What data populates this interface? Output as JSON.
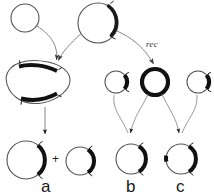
{
  "figure": {
    "background_color": "#ffffff",
    "line_color": "#4d4d4d",
    "bold_color": "#111111",
    "width": 214,
    "height": 196
  },
  "labels": {
    "rec": "rec",
    "plus": "+",
    "panel_a": "a",
    "panel_b": "b",
    "panel_c": "c"
  },
  "diagram_data": {
    "type": "diagram",
    "nodes": [
      {
        "id": "top-left-circle",
        "name": "small-thin-circle-top-left",
        "shape": "circle",
        "cx": 25,
        "cy": 18,
        "r": 14,
        "stroke": "thin",
        "segments": []
      },
      {
        "id": "top-center-circle",
        "name": "circle-top-center-with-thick-arc",
        "shape": "circle",
        "cx": 98,
        "cy": 23,
        "r": 20,
        "stroke": "thin",
        "segments": [
          {
            "type": "thick-arc",
            "start_deg": -58,
            "end_deg": 48,
            "ticks": 2
          }
        ]
      },
      {
        "id": "left-lens",
        "name": "heteroduplex-lens-shape",
        "shape": "lens",
        "cx": 38,
        "cy": 83,
        "rx": 33,
        "ry": 22,
        "stroke": "thin",
        "segments": [
          {
            "type": "thick-arc",
            "position": "upper",
            "ticks": 2
          },
          {
            "type": "thick-arc",
            "position": "lower",
            "ticks": 2
          }
        ]
      },
      {
        "id": "mid-small-circle",
        "name": "small-circle-mid-left-with-arc",
        "shape": "circle",
        "cx": 116,
        "cy": 82,
        "r": 11,
        "stroke": "thin",
        "segments": [
          {
            "type": "thick-arc",
            "start_deg": -25,
            "end_deg": 25,
            "ticks": 2
          }
        ]
      },
      {
        "id": "mid-bold-circle",
        "name": "bold-circle-recombinant",
        "shape": "circle",
        "cx": 155,
        "cy": 82,
        "r": 13,
        "stroke": "bold",
        "segments": []
      },
      {
        "id": "mid-right-circle",
        "name": "small-circle-mid-right-with-arc",
        "shape": "circle",
        "cx": 198,
        "cy": 82,
        "r": 11,
        "stroke": "thin",
        "segments": [
          {
            "type": "thick-arc",
            "start_deg": -25,
            "end_deg": 25,
            "ticks": 2
          }
        ]
      },
      {
        "id": "a-large-circle",
        "name": "panel-a-large-product-circle",
        "shape": "circle",
        "cx": 26,
        "cy": 160,
        "r": 19,
        "stroke": "thin",
        "segments": [
          {
            "type": "thick-arc",
            "start_deg": -52,
            "end_deg": 52,
            "ticks": 2
          }
        ]
      },
      {
        "id": "a-small-circle",
        "name": "panel-a-small-product-circle",
        "shape": "circle",
        "cx": 80,
        "cy": 161,
        "r": 14,
        "stroke": "thin",
        "segments": [
          {
            "type": "thick-arc",
            "start_deg": -55,
            "end_deg": 55,
            "ticks": 2
          }
        ]
      },
      {
        "id": "b-circle",
        "name": "panel-b-product-circle",
        "shape": "circle",
        "cx": 131,
        "cy": 159,
        "r": 15,
        "stroke": "thin",
        "segments": [
          {
            "type": "thick-arc",
            "start_deg": -58,
            "end_deg": 58,
            "ticks": 2
          }
        ]
      },
      {
        "id": "c-circle",
        "name": "panel-c-product-circle",
        "shape": "circle",
        "cx": 181,
        "cy": 159,
        "r": 15,
        "stroke": "thin",
        "segments": [
          {
            "type": "thick-arc",
            "start_deg": -58,
            "end_deg": 58,
            "ticks": 2
          },
          {
            "type": "thick-mark",
            "position_deg": 175
          }
        ]
      }
    ],
    "edges": [
      {
        "from": "top-left-circle",
        "to": "left-lens",
        "style": "curved-arrow"
      },
      {
        "from": "top-center-circle",
        "to": "left-lens",
        "style": "curved-arrow"
      },
      {
        "from": "top-center-circle",
        "to": "mid-bold-circle",
        "style": "curved-arrow",
        "label": "rec"
      },
      {
        "from": "left-lens",
        "to": "a-large-circle",
        "style": "straight-arrow"
      },
      {
        "from": "mid-bold-circle",
        "to": "b-circle",
        "style": "curved-arrow"
      },
      {
        "from": "mid-bold-circle",
        "to": "c-circle",
        "style": "curved-arrow"
      },
      {
        "from": "mid-right-circle",
        "to": "c-circle",
        "style": "curved-arrow"
      },
      {
        "from": "mid-small-circle",
        "to": "b-circle",
        "style": "curved-arrow"
      }
    ]
  }
}
